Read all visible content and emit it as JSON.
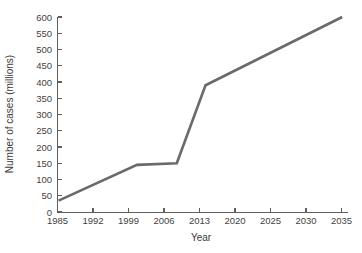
{
  "figure": {
    "background_color": "#ffffff",
    "axis_color": "#5e5e5e",
    "text_color": "#3f3f3f"
  },
  "chart_data": {
    "type": "line",
    "title": "",
    "xlabel": "Year",
    "ylabel": "Number of cases (millions)",
    "xlim": [
      1985,
      2035
    ],
    "ylim": [
      0,
      600
    ],
    "grid": false,
    "legend": null,
    "line_color": "#6a6a6a",
    "line_width": 2.6,
    "x_tick_labels": [
      "1985",
      "1992",
      "1999",
      "2006",
      "2013",
      "2020",
      "2025",
      "2030",
      "2035"
    ],
    "y_tick_labels": [
      "0",
      "50",
      "100",
      "150",
      "200",
      "250",
      "300",
      "350",
      "400",
      "450",
      "500",
      "550",
      "600"
    ],
    "y_ticks": [
      0,
      50,
      100,
      150,
      200,
      250,
      300,
      350,
      400,
      450,
      500,
      550,
      600
    ],
    "x_tick_positions": [
      0,
      1,
      2,
      3,
      4,
      5,
      6,
      7,
      8
    ],
    "series": [
      {
        "name": "Number of cases",
        "points": [
          {
            "x_label": "1985",
            "x_pos": 0.03,
            "y": 35
          },
          {
            "x_label": "2000",
            "x_pos": 2.24,
            "y": 145
          },
          {
            "x_label": "2008",
            "x_pos": 3.36,
            "y": 150
          },
          {
            "x_label": "2014",
            "x_pos": 4.17,
            "y": 390
          },
          {
            "x_label": "2035",
            "x_pos": 8.02,
            "y": 600
          }
        ]
      }
    ]
  },
  "axis_labels": {
    "x_title": "Year",
    "y_title": "Number of cases (millions)"
  }
}
